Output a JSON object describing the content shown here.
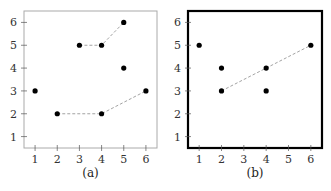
{
  "chart_data": [
    {
      "type": "scatter",
      "panel_label": "(a)",
      "frame": {
        "style": "thin-gray"
      },
      "xticks": [
        1,
        2,
        3,
        4,
        5,
        6
      ],
      "yticks": [
        1,
        2,
        3,
        4,
        5,
        6
      ],
      "xlim": [
        0.5,
        6.5
      ],
      "ylim": [
        0.5,
        6.5
      ],
      "grid": false,
      "points": [
        {
          "x": 1,
          "y": 3
        },
        {
          "x": 2,
          "y": 2
        },
        {
          "x": 4,
          "y": 2
        },
        {
          "x": 6,
          "y": 3
        },
        {
          "x": 3,
          "y": 5
        },
        {
          "x": 4,
          "y": 5
        },
        {
          "x": 5,
          "y": 6
        },
        {
          "x": 5,
          "y": 4
        }
      ],
      "dashed_paths": [
        [
          {
            "x": 2,
            "y": 2
          },
          {
            "x": 4,
            "y": 2
          },
          {
            "x": 6,
            "y": 3
          }
        ],
        [
          {
            "x": 3,
            "y": 5
          },
          {
            "x": 4,
            "y": 5
          },
          {
            "x": 5,
            "y": 6
          }
        ]
      ]
    },
    {
      "type": "scatter",
      "panel_label": "(b)",
      "frame": {
        "style": "thick-black"
      },
      "xticks": [
        1,
        2,
        3,
        4,
        5,
        6
      ],
      "yticks": [
        1,
        2,
        3,
        4,
        5,
        6
      ],
      "xlim": [
        0.5,
        6.5
      ],
      "ylim": [
        0.5,
        6.5
      ],
      "grid": false,
      "points": [
        {
          "x": 1,
          "y": 5
        },
        {
          "x": 2,
          "y": 4
        },
        {
          "x": 2,
          "y": 3
        },
        {
          "x": 4,
          "y": 4
        },
        {
          "x": 4,
          "y": 3
        },
        {
          "x": 6,
          "y": 5
        }
      ],
      "dashed_paths": [
        [
          {
            "x": 2,
            "y": 3
          },
          {
            "x": 4,
            "y": 4
          },
          {
            "x": 6,
            "y": 5
          }
        ]
      ]
    }
  ],
  "colors": {
    "point": "#000000",
    "dash": "#999999",
    "frame_a": "#aaaaaa",
    "frame_b": "#000000",
    "tick": "#555555"
  }
}
